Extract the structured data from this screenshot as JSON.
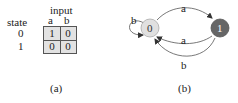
{
  "table": {
    "header_group": "input",
    "row_header": "state",
    "columns": [
      "a",
      "b"
    ],
    "rows": [
      {
        "state": "0",
        "values": [
          "1",
          "0"
        ]
      },
      {
        "state": "1",
        "values": [
          "0",
          "0"
        ]
      }
    ],
    "caption": "(a)",
    "cell_bg": "#e2e2e2"
  },
  "graph": {
    "nodes": [
      {
        "id": "0",
        "label": "0",
        "fill": "#e0e0e0",
        "text_color": "#333333"
      },
      {
        "id": "1",
        "label": "1",
        "fill": "#666666",
        "text_color": "#ffffff"
      }
    ],
    "edges": [
      {
        "from": "0",
        "to": "0",
        "label": "b"
      },
      {
        "from": "0",
        "to": "1",
        "label": "a"
      },
      {
        "from": "1",
        "to": "0",
        "label": "a"
      },
      {
        "from": "1",
        "to": "0",
        "label": "b"
      }
    ],
    "caption": "(b)"
  }
}
